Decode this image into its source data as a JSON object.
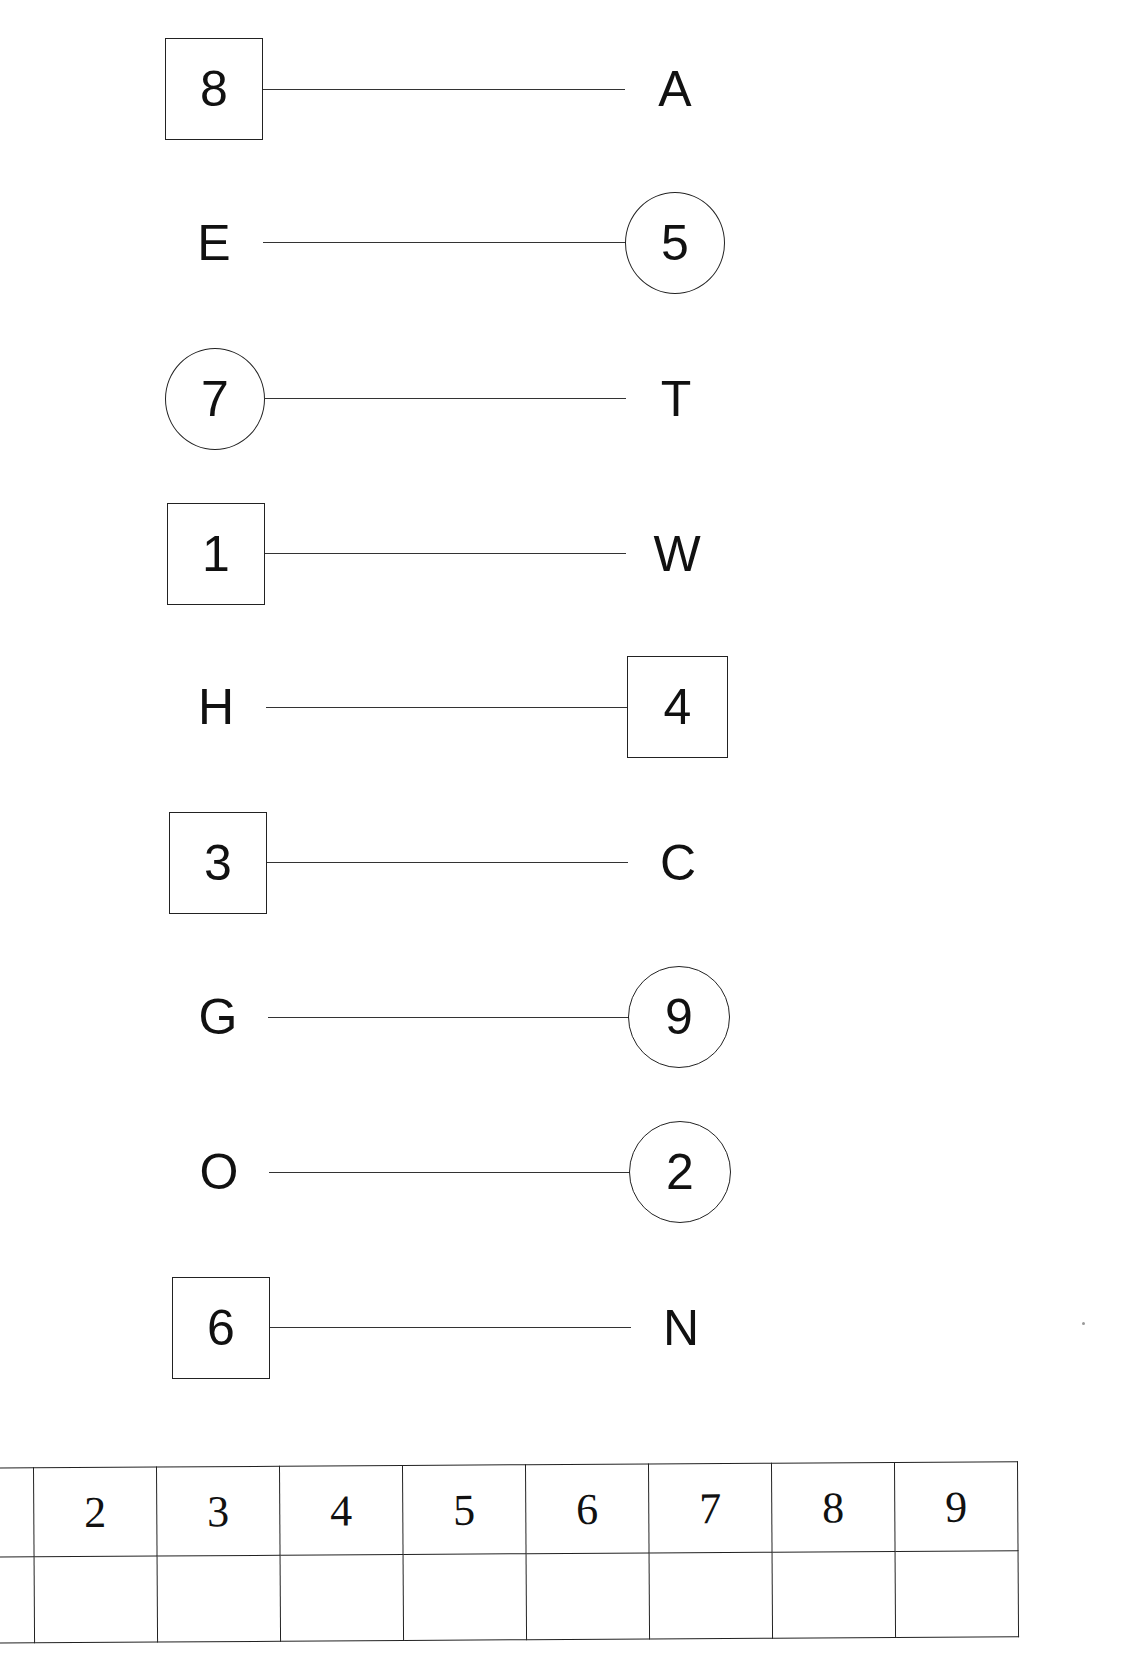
{
  "rows": [
    {
      "left": {
        "text": "8",
        "shape": "box"
      },
      "right": {
        "text": "A",
        "shape": "plain"
      }
    },
    {
      "left": {
        "text": "E",
        "shape": "plain"
      },
      "right": {
        "text": "5",
        "shape": "circle"
      }
    },
    {
      "left": {
        "text": "7",
        "shape": "circle"
      },
      "right": {
        "text": "T",
        "shape": "plain"
      }
    },
    {
      "left": {
        "text": "1",
        "shape": "box"
      },
      "right": {
        "text": "W",
        "shape": "plain"
      }
    },
    {
      "left": {
        "text": "H",
        "shape": "plain"
      },
      "right": {
        "text": "4",
        "shape": "box"
      }
    },
    {
      "left": {
        "text": "3",
        "shape": "box"
      },
      "right": {
        "text": "C",
        "shape": "plain"
      }
    },
    {
      "left": {
        "text": "G",
        "shape": "plain"
      },
      "right": {
        "text": "9",
        "shape": "circle"
      }
    },
    {
      "left": {
        "text": "O",
        "shape": "plain"
      },
      "right": {
        "text": "2",
        "shape": "circle"
      }
    },
    {
      "left": {
        "text": "6",
        "shape": "box"
      },
      "right": {
        "text": "N",
        "shape": "plain"
      }
    }
  ],
  "key_table": {
    "header": [
      "1",
      "2",
      "3",
      "4",
      "5",
      "6",
      "7",
      "8",
      "9"
    ],
    "answers": [
      "",
      "",
      "",
      "",
      "",
      "",
      "",
      "",
      ""
    ]
  }
}
